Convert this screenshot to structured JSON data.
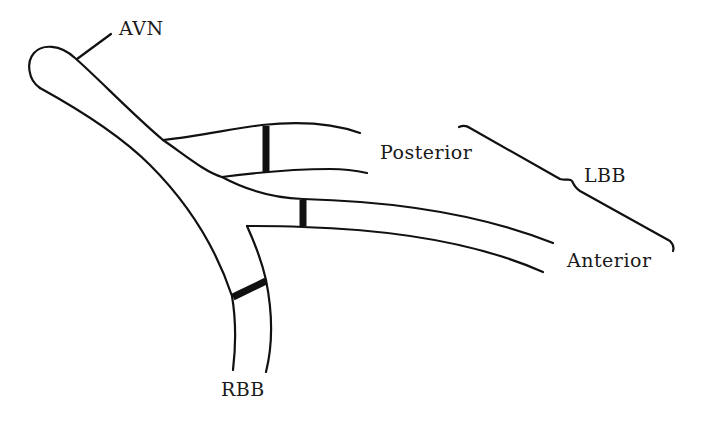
{
  "diagram": {
    "title": "",
    "labels": {
      "avn": "AVN",
      "posterior": "Posterior",
      "lbb": "LBB",
      "anterior": "Anterior",
      "rbb": "RBB"
    },
    "structures": [
      {
        "id": "avn",
        "name": "Atrioventricular node",
        "label": "AVN"
      },
      {
        "id": "lbb-posterior",
        "name": "Left bundle branch posterior fascicle",
        "label": "Posterior",
        "has_block": true
      },
      {
        "id": "lbb-anterior",
        "name": "Left bundle branch anterior fascicle",
        "label": "Anterior",
        "has_block": true
      },
      {
        "id": "rbb",
        "name": "Right bundle branch",
        "label": "RBB",
        "has_block": true
      }
    ],
    "groupings": [
      {
        "brace": "LBB",
        "members": [
          "Posterior",
          "Anterior"
        ]
      }
    ],
    "colors": {
      "line": "#111111",
      "background": "#ffffff",
      "text": "#1a1a1a"
    }
  }
}
